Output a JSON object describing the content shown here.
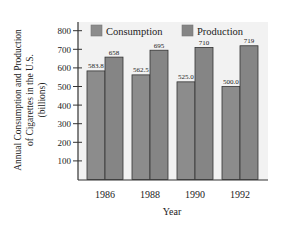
{
  "chart_data": {
    "type": "bar",
    "title": "",
    "xlabel": "Year",
    "ylabel_lines": [
      "Annual Consumption and Production",
      "of Cigarettes in the U.S.",
      "(billions)"
    ],
    "categories": [
      "1986",
      "1988",
      "1990",
      "1992"
    ],
    "series": [
      {
        "name": "Consumption",
        "values": [
          583.8,
          562.5,
          525.0,
          500.0
        ],
        "labels": [
          "583.8",
          "562.5",
          "525.0",
          "500.0"
        ],
        "color": "#8c8c8c"
      },
      {
        "name": "Production",
        "values": [
          658,
          695,
          710,
          719
        ],
        "labels": [
          "658",
          "695",
          "710",
          "719"
        ],
        "color": "#858585"
      }
    ],
    "yticks": [
      100,
      200,
      300,
      400,
      500,
      600,
      700,
      800
    ],
    "ytick_labels": [
      "100",
      "200",
      "300",
      "400",
      "500",
      "600",
      "700",
      "800"
    ],
    "ylim": [
      0,
      850
    ],
    "grid": false,
    "legend": {
      "placement": "top",
      "entries": [
        "Consumption",
        "Production"
      ]
    },
    "colors": {
      "plot_background": "#f2f2f2",
      "bar_stroke": "#333333",
      "axis": "#333333"
    }
  }
}
